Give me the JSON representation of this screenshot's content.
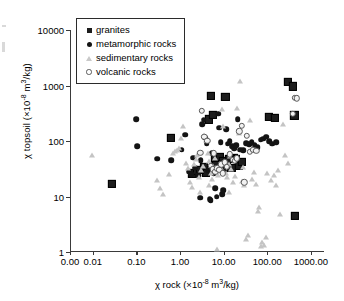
{
  "chart_data": {
    "type": "scatter",
    "title": "",
    "xlabel": "χ rock (×10−8 m³/kg)",
    "ylabel": "χ topsoil (×10−8 m³/kg)",
    "xlabel_parts": {
      "prefix": "χ rock (×10",
      "exp": "-8",
      "suffix": " m",
      "exp2": "3",
      "suffix2": "/kg)"
    },
    "ylabel_parts": {
      "prefix": "χ topsoil (×10",
      "exp": "-8",
      "suffix": " m",
      "exp2": "3",
      "suffix2": "/kg)"
    },
    "xscale": "log",
    "yscale": "log",
    "xlim": [
      0.003,
      2000
    ],
    "ylim": [
      1,
      10000
    ],
    "grid": false,
    "legend_position": "upper-left-inside",
    "xticks": [
      "0.00",
      "0.01",
      "0.10",
      "1.00",
      "10.00",
      "100.00",
      "1000.00"
    ],
    "xtick_values": [
      0.003,
      0.01,
      0.1,
      1,
      10,
      100,
      1000
    ],
    "yticks": [
      "1",
      "10",
      "100",
      "1000",
      "10000"
    ],
    "ytick_values": [
      1,
      10,
      100,
      1000,
      10000
    ],
    "series": [
      {
        "name": "granites",
        "marker": "filled-square",
        "color": "#1d1d1d",
        "points": [
          [
            0.027,
            17
          ],
          [
            0.62,
            115
          ],
          [
            1.9,
            26
          ],
          [
            2.4,
            29
          ],
          [
            3.6,
            34
          ],
          [
            4.6,
            245
          ],
          [
            5.2,
            660
          ],
          [
            5.6,
            300
          ],
          [
            6.3,
            45
          ],
          [
            7.0,
            38
          ],
          [
            8.2,
            52
          ],
          [
            9.0,
            31
          ],
          [
            9.8,
            44
          ],
          [
            11.0,
            630
          ],
          [
            12.0,
            40
          ],
          [
            13.5,
            47
          ],
          [
            15.0,
            33
          ],
          [
            17.0,
            50
          ],
          [
            19.0,
            48
          ],
          [
            22.0,
            36
          ],
          [
            26.0,
            42
          ],
          [
            110.0,
            270
          ],
          [
            150.0,
            260
          ],
          [
            300.0,
            1150
          ],
          [
            390.0,
            960
          ],
          [
            420.0,
            290
          ],
          [
            430.0,
            4.5
          ],
          [
            4.0,
            27
          ],
          [
            2.8,
            30
          ],
          [
            6.8,
            37
          ]
        ]
      },
      {
        "name": "metamorphic rocks",
        "marker": "filled-circle",
        "color": "#141414",
        "points": [
          [
            0.1,
            250
          ],
          [
            0.105,
            80
          ],
          [
            0.3,
            48
          ],
          [
            0.62,
            45
          ],
          [
            1.1,
            70
          ],
          [
            1.3,
            130
          ],
          [
            1.6,
            28
          ],
          [
            1.8,
            25
          ],
          [
            2.2,
            33
          ],
          [
            2.6,
            24
          ],
          [
            2.9,
            9.5
          ],
          [
            3.2,
            200
          ],
          [
            3.5,
            240
          ],
          [
            3.8,
            115
          ],
          [
            4.1,
            90
          ],
          [
            4.4,
            30
          ],
          [
            4.8,
            9.0
          ],
          [
            5.1,
            8.6
          ],
          [
            5.5,
            60
          ],
          [
            5.9,
            26
          ],
          [
            6.4,
            14
          ],
          [
            6.9,
            10
          ],
          [
            7.4,
            310
          ],
          [
            7.9,
            175
          ],
          [
            8.5,
            95
          ],
          [
            9.2,
            11
          ],
          [
            9.9,
            13
          ],
          [
            10.5,
            28
          ],
          [
            11.5,
            165
          ],
          [
            12.5,
            90
          ],
          [
            13.8,
            100
          ],
          [
            15.5,
            80
          ],
          [
            17.5,
            75
          ],
          [
            19.5,
            85
          ],
          [
            21.0,
            250
          ],
          [
            24.0,
            70
          ],
          [
            28.0,
            68
          ],
          [
            33.0,
            92
          ],
          [
            38.0,
            88
          ],
          [
            44.0,
            95
          ],
          [
            52.0,
            84
          ],
          [
            60.0,
            78
          ],
          [
            70.0,
            105
          ],
          [
            80.0,
            110
          ],
          [
            95.0,
            120
          ],
          [
            110.0,
            100
          ],
          [
            130.0,
            90
          ],
          [
            160.0,
            95
          ],
          [
            2.0,
            50
          ],
          [
            3.0,
            45
          ]
        ]
      },
      {
        "name": "sedimentary rocks",
        "marker": "open-triangle",
        "color": "#c4c4c4",
        "points": [
          [
            0.0095,
            55
          ],
          [
            0.3,
            20
          ],
          [
            0.34,
            14
          ],
          [
            0.4,
            11
          ],
          [
            0.55,
            25
          ],
          [
            0.7,
            60
          ],
          [
            0.78,
            65
          ],
          [
            0.85,
            70
          ],
          [
            0.95,
            75
          ],
          [
            1.05,
            115
          ],
          [
            1.2,
            190
          ],
          [
            1.4,
            40
          ],
          [
            1.5,
            32
          ],
          [
            1.7,
            18
          ],
          [
            1.9,
            15
          ],
          [
            2.1,
            38
          ],
          [
            2.3,
            47
          ],
          [
            2.5,
            55
          ],
          [
            2.7,
            22
          ],
          [
            3.0,
            30
          ],
          [
            3.3,
            36
          ],
          [
            3.6,
            130
          ],
          [
            4.0,
            105
          ],
          [
            4.3,
            60
          ],
          [
            4.7,
            43
          ],
          [
            5.0,
            26
          ],
          [
            5.4,
            21
          ],
          [
            5.8,
            35
          ],
          [
            6.2,
            50
          ],
          [
            6.6,
            30
          ],
          [
            7.0,
            1.15
          ],
          [
            7.5,
            24
          ],
          [
            8.0,
            29
          ],
          [
            8.6,
            33
          ],
          [
            9.2,
            370
          ],
          [
            9.8,
            190
          ],
          [
            10.5,
            44
          ],
          [
            11.2,
            27
          ],
          [
            12.0,
            22
          ],
          [
            13.0,
            39
          ],
          [
            14.0,
            53
          ],
          [
            15.0,
            31
          ],
          [
            16.5,
            18
          ],
          [
            18.0,
            23
          ],
          [
            20.0,
            400
          ],
          [
            22.0,
            140
          ],
          [
            24.0,
            1200
          ],
          [
            26.0,
            19
          ],
          [
            28.0,
            34
          ],
          [
            30.0,
            16
          ],
          [
            33.0,
            1.7
          ],
          [
            36.0,
            2.0
          ],
          [
            40.0,
            240
          ],
          [
            45.0,
            21
          ],
          [
            50.0,
            28
          ],
          [
            55.0,
            17
          ],
          [
            60.0,
            5.5
          ],
          [
            65.0,
            6.5
          ],
          [
            70.0,
            1.3
          ],
          [
            75.0,
            1.5
          ],
          [
            85.0,
            1.35
          ],
          [
            95.0,
            1.9
          ],
          [
            100.0,
            27
          ],
          [
            120.0,
            20
          ],
          [
            140.0,
            24
          ],
          [
            160.0,
            16
          ],
          [
            180.0,
            30
          ],
          [
            200.0,
            4.8
          ],
          [
            230.0,
            200
          ],
          [
            260.0,
            55
          ],
          [
            300.0,
            40
          ],
          [
            13.5,
            12
          ],
          [
            4.5,
            16
          ],
          [
            2.8,
            12
          ]
        ]
      },
      {
        "name": "volcanic rocks",
        "marker": "open-circle",
        "color": "#5a5a5a",
        "points": [
          [
            3.2,
            350
          ],
          [
            3.6,
            120
          ],
          [
            4.2,
            100
          ],
          [
            5.0,
            36
          ],
          [
            5.6,
            31
          ],
          [
            6.4,
            28
          ],
          [
            7.2,
            32
          ],
          [
            8.0,
            30
          ],
          [
            8.8,
            38
          ],
          [
            9.6,
            26
          ],
          [
            10.5,
            41
          ],
          [
            12.0,
            34
          ],
          [
            14.0,
            58
          ],
          [
            16.0,
            46
          ],
          [
            18.0,
            44
          ],
          [
            20.0,
            49
          ],
          [
            23.0,
            150
          ],
          [
            26.0,
            190
          ],
          [
            30.0,
            18
          ],
          [
            34.0,
            125
          ],
          [
            40.0,
            64
          ],
          [
            48.0,
            70
          ],
          [
            56.0,
            66
          ],
          [
            380.0,
            310
          ],
          [
            430.0,
            600
          ],
          [
            470.0,
            590
          ],
          [
            2.9,
            62
          ],
          [
            6.0,
            60
          ]
        ]
      }
    ]
  },
  "legend": {
    "items": [
      {
        "label": "granites",
        "marker": "filled-square"
      },
      {
        "label": "metamorphic rocks",
        "marker": "filled-circle"
      },
      {
        "label": "sedimentary rocks",
        "marker": "open-triangle"
      },
      {
        "label": "volcanic rocks",
        "marker": "open-circle"
      }
    ]
  }
}
